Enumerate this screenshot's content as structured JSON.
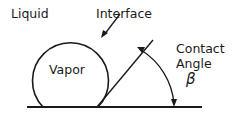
{
  "diagram": {
    "labels": {
      "liquid": "Liquid",
      "interface": "Interface",
      "vapor": "Vapor",
      "contact": "Contact",
      "angle": "Angle",
      "beta": "β"
    },
    "colors": {
      "stroke": "#1a1a1a",
      "background": "#ffffff"
    }
  }
}
